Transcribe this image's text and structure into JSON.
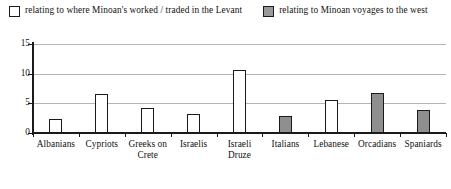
{
  "legend": {
    "entries": [
      {
        "label": "relating to where Minoan's worked / traded in the Levant",
        "style": "hollow",
        "color": "#ffffff"
      },
      {
        "label": "relating to Minoan voyages to the west",
        "style": "filled",
        "color": "#9a9a9a"
      }
    ]
  },
  "chart_data": {
    "type": "bar",
    "title": "",
    "xlabel": "",
    "ylabel": "",
    "ylim": [
      0,
      15
    ],
    "yticks": [
      0,
      5,
      10,
      15
    ],
    "ytick_labels": [
      "0",
      "5",
      "10",
      "15"
    ],
    "grid": true,
    "legend_position": "top",
    "categories": [
      "Albanians",
      "Cypriots",
      "Greeks on Crete",
      "Israelis",
      "Israeli Druze",
      "Italians",
      "Lebanese",
      "Orcadians",
      "Spaniards"
    ],
    "category_lines": [
      [
        "Albanians"
      ],
      [
        "Cypriots"
      ],
      [
        "Greeks on",
        "Crete"
      ],
      [
        "Israelis"
      ],
      [
        "Israeli",
        "Druze"
      ],
      [
        "Italians"
      ],
      [
        "Lebanese"
      ],
      [
        "Orcadians"
      ],
      [
        "Spaniards"
      ]
    ],
    "values": [
      2.4,
      6.5,
      4.2,
      3.2,
      10.6,
      2.8,
      5.6,
      6.8,
      3.9
    ],
    "series_of_bar": [
      "relating to where Minoan's worked / traded in the Levant",
      "relating to where Minoan's worked / traded in the Levant",
      "relating to where Minoan's worked / traded in the Levant",
      "relating to where Minoan's worked / traded in the Levant",
      "relating to where Minoan's worked / traded in the Levant",
      "relating to Minoan voyages to the west",
      "relating to where Minoan's worked / traded in the Levant",
      "relating to Minoan voyages to the west",
      "relating to Minoan voyages to the west"
    ],
    "bar_styles": [
      "hollow",
      "hollow",
      "hollow",
      "hollow",
      "hollow",
      "filled",
      "hollow",
      "filled",
      "filled"
    ]
  },
  "colors": {
    "bar_hollow_fill": "#ffffff",
    "bar_filled_fill": "#8f8f8f",
    "bar_stroke": "#1a1a1a",
    "gridline": "#b4b4b4",
    "axis": "#1a1a1a",
    "background": "#ffffff"
  }
}
